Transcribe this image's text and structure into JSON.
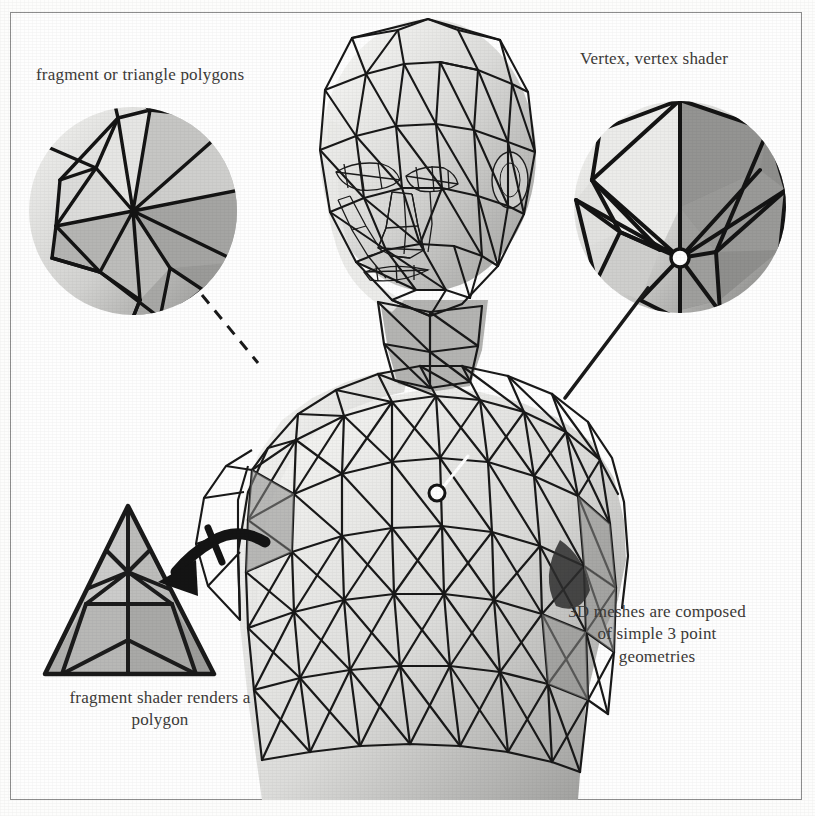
{
  "figure": {
    "background_color": "#fdfdfc",
    "border_color": "#8d8d8d",
    "ink_color": "#1a1a1a",
    "text_color": "#3c3a38"
  },
  "captions": {
    "fragment_polygons": "fragment or triangle polygons",
    "vertex_shader": "Vertex, vertex shader",
    "mesh_composed": "3D meshes are composed\nof simple 3 point\ngeometries",
    "fragment_shader": "fragment shader renders a\npolygon"
  },
  "callouts": [
    {
      "name": "fragment-polygons-magnifier",
      "label": "fragment or triangle polygons",
      "center_x": 133,
      "center_y": 211,
      "radius": 104,
      "leader": "dashed",
      "target_x": 250,
      "target_y": 360
    },
    {
      "name": "vertex-shader-magnifier",
      "label": "Vertex, vertex shader",
      "center_x": 680,
      "center_y": 207,
      "radius": 106,
      "leader": "solid",
      "target_x": 563,
      "target_y": 395,
      "vertex_marker_x": 680,
      "vertex_marker_y": 258
    }
  ],
  "markers": [
    {
      "name": "mesh-vertex-marker",
      "x": 437,
      "y": 493,
      "radius": 7,
      "fill": "#ffffff"
    }
  ],
  "triangle_swatch": {
    "name": "fragment-shader-triangle",
    "apex_x": 128,
    "apex_y": 506,
    "left_x": 45,
    "right_x": 214,
    "base_y": 674,
    "subdivisions": 3,
    "label": "fragment shader renders a polygon"
  },
  "arrow": {
    "name": "fragment-shader-arrow",
    "from_x": 243,
    "from_y": 538,
    "to_x": 160,
    "to_y": 578,
    "style": "curved-hand-drawn"
  },
  "model": {
    "name": "low-poly-bust",
    "description": "Wireframe triangulated human head, neck, shoulders and chest bust",
    "parts": [
      "head",
      "face",
      "ear",
      "neck",
      "shoulders",
      "chest",
      "torso-base"
    ]
  },
  "palette": {
    "lightest": "#f2f2f0",
    "light": "#dedede",
    "mid": "#c2c2c2",
    "mid_dark": "#a3a3a3",
    "dark": "#8a8a8a",
    "darkest": "#6a6a6a",
    "line": "#161616",
    "white": "#ffffff"
  }
}
